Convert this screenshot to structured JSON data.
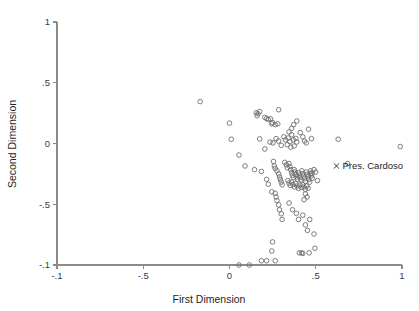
{
  "chart_data": {
    "type": "scatter",
    "title": "",
    "xlabel": "First Dimension",
    "ylabel": "Second Dimension",
    "xlim": [
      -1,
      1
    ],
    "ylim": [
      -1,
      1
    ],
    "grid": false,
    "legend": "none",
    "xticks": [
      -1,
      -0.5,
      0,
      0.5,
      1
    ],
    "xticklabels": [
      "-.1",
      "-.5",
      "0",
      ".5",
      "1"
    ],
    "yticks": [
      -1,
      -0.5,
      0,
      0.5,
      1
    ],
    "yticklabels": [
      "-.1",
      "-.5",
      "0",
      ".5",
      "1"
    ],
    "marker": "open-circle",
    "marker_color": "#6e6e6e",
    "annotations": [
      {
        "label": "Pres. Cardoso",
        "marker": "x",
        "x": 0.62,
        "y": -0.185,
        "color": "#1f1f1f"
      }
    ],
    "points": [
      [
        -0.17,
        0.345
      ],
      [
        0.0,
        0.168
      ],
      [
        0.01,
        0.035
      ],
      [
        0.055,
        -0.095
      ],
      [
        0.09,
        -0.185
      ],
      [
        0.155,
        0.253
      ],
      [
        0.16,
        0.228
      ],
      [
        0.165,
        0.245
      ],
      [
        0.175,
        0.263
      ],
      [
        0.205,
        0.215
      ],
      [
        0.215,
        0.205
      ],
      [
        0.225,
        0.198
      ],
      [
        0.238,
        0.203
      ],
      [
        0.245,
        0.162
      ],
      [
        0.25,
        0.172
      ],
      [
        0.285,
        0.278
      ],
      [
        0.175,
        0.038
      ],
      [
        0.205,
        -0.045
      ],
      [
        0.145,
        -0.215
      ],
      [
        0.185,
        -0.23
      ],
      [
        0.215,
        -0.295
      ],
      [
        0.225,
        -0.335
      ],
      [
        0.245,
        -0.398
      ],
      [
        0.255,
        -0.148
      ],
      [
        0.26,
        -0.185
      ],
      [
        0.265,
        -0.205
      ],
      [
        0.275,
        -0.225
      ],
      [
        0.285,
        -0.25
      ],
      [
        0.29,
        -0.275
      ],
      [
        0.295,
        -0.295
      ],
      [
        0.3,
        -0.318
      ],
      [
        0.305,
        -0.34
      ],
      [
        0.265,
        -0.41
      ],
      [
        0.27,
        -0.44
      ],
      [
        0.275,
        -0.47
      ],
      [
        0.285,
        -0.505
      ],
      [
        0.29,
        -0.545
      ],
      [
        0.3,
        -0.578
      ],
      [
        0.235,
        0.012
      ],
      [
        0.252,
        0.005
      ],
      [
        0.27,
        0.04
      ],
      [
        0.285,
        0.02
      ],
      [
        0.3,
        -0.015
      ],
      [
        0.315,
        0.055
      ],
      [
        0.325,
        0.03
      ],
      [
        0.335,
        -0.01
      ],
      [
        0.34,
        0.045
      ],
      [
        0.35,
        0.015
      ],
      [
        0.355,
        -0.03
      ],
      [
        0.36,
        0.072
      ],
      [
        0.37,
        0.03
      ],
      [
        0.375,
        -0.02
      ],
      [
        0.385,
        0.042
      ],
      [
        0.39,
        0.012
      ],
      [
        0.32,
        -0.155
      ],
      [
        0.33,
        -0.175
      ],
      [
        0.335,
        -0.2
      ],
      [
        0.345,
        -0.165
      ],
      [
        0.35,
        -0.19
      ],
      [
        0.355,
        -0.215
      ],
      [
        0.36,
        -0.24
      ],
      [
        0.365,
        -0.26
      ],
      [
        0.37,
        -0.28
      ],
      [
        0.375,
        -0.215
      ],
      [
        0.38,
        -0.235
      ],
      [
        0.385,
        -0.255
      ],
      [
        0.39,
        -0.275
      ],
      [
        0.395,
        -0.295
      ],
      [
        0.4,
        -0.24
      ],
      [
        0.405,
        -0.26
      ],
      [
        0.41,
        -0.28
      ],
      [
        0.415,
        -0.3
      ],
      [
        0.42,
        -0.225
      ],
      [
        0.425,
        -0.248
      ],
      [
        0.43,
        -0.268
      ],
      [
        0.435,
        -0.29
      ],
      [
        0.44,
        -0.312
      ],
      [
        0.445,
        -0.235
      ],
      [
        0.45,
        -0.255
      ],
      [
        0.455,
        -0.275
      ],
      [
        0.46,
        -0.297
      ],
      [
        0.465,
        -0.318
      ],
      [
        0.47,
        -0.245
      ],
      [
        0.475,
        -0.265
      ],
      [
        0.48,
        -0.285
      ],
      [
        0.338,
        -0.305
      ],
      [
        0.345,
        -0.325
      ],
      [
        0.352,
        -0.345
      ],
      [
        0.36,
        -0.318
      ],
      [
        0.368,
        -0.338
      ],
      [
        0.376,
        -0.358
      ],
      [
        0.384,
        -0.33
      ],
      [
        0.392,
        -0.35
      ],
      [
        0.4,
        -0.37
      ],
      [
        0.408,
        -0.342
      ],
      [
        0.416,
        -0.362
      ],
      [
        0.424,
        -0.338
      ],
      [
        0.432,
        -0.358
      ],
      [
        0.44,
        -0.378
      ],
      [
        0.448,
        -0.35
      ],
      [
        0.456,
        -0.368
      ],
      [
        0.44,
        -0.415
      ],
      [
        0.45,
        -0.44
      ],
      [
        0.432,
        -0.462
      ],
      [
        0.47,
        -0.225
      ],
      [
        0.478,
        -0.245
      ],
      [
        0.49,
        -0.215
      ],
      [
        0.5,
        -0.235
      ],
      [
        0.51,
        -0.305
      ],
      [
        0.345,
        0.095
      ],
      [
        0.36,
        0.125
      ],
      [
        0.372,
        0.155
      ],
      [
        0.39,
        0.185
      ],
      [
        0.41,
        0.09
      ],
      [
        0.425,
        0.055
      ],
      [
        0.435,
        0.02
      ],
      [
        0.445,
        0.005
      ],
      [
        0.458,
        0.118
      ],
      [
        0.475,
        0.04
      ],
      [
        0.63,
        0.035
      ],
      [
        0.265,
        0.155
      ],
      [
        0.28,
        0.162
      ],
      [
        0.685,
        -0.165
      ],
      [
        0.99,
        -0.025
      ],
      [
        0.305,
        -0.625
      ],
      [
        0.345,
        -0.49
      ],
      [
        0.365,
        -0.545
      ],
      [
        0.388,
        -0.575
      ],
      [
        0.4,
        -0.625
      ],
      [
        0.425,
        -0.59
      ],
      [
        0.44,
        -0.67
      ],
      [
        0.465,
        -0.625
      ],
      [
        0.452,
        -0.715
      ],
      [
        0.49,
        -0.745
      ],
      [
        0.25,
        -0.81
      ],
      [
        0.245,
        -0.885
      ],
      [
        0.265,
        -0.965
      ],
      [
        0.055,
        -1.0
      ],
      [
        0.115,
        -1.0
      ],
      [
        0.185,
        -0.965
      ],
      [
        0.215,
        -0.965
      ],
      [
        0.405,
        -0.9
      ],
      [
        0.418,
        -0.9
      ],
      [
        0.425,
        -0.905
      ],
      [
        0.462,
        -0.9
      ],
      [
        0.495,
        -0.862
      ]
    ]
  }
}
